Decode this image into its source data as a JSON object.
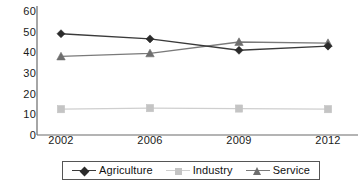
{
  "chart_data": {
    "type": "line",
    "title": "",
    "xlabel": "",
    "ylabel": "",
    "categories": [
      "2002",
      "2006",
      "2009",
      "2012"
    ],
    "x": [
      2002,
      2006,
      2009,
      2012
    ],
    "ylim": [
      0,
      60
    ],
    "yticks": [
      0,
      10,
      20,
      30,
      40,
      50,
      60
    ],
    "ytick_labels": [
      "0",
      "10",
      "20",
      "30",
      "40",
      "50",
      "60"
    ],
    "grid": false,
    "legend_position": "bottom",
    "series": [
      {
        "name": "Agriculture",
        "marker": "diamond",
        "color": "#2b2b2b",
        "line_color": "#3a3a3a",
        "values": [
          49,
          46.5,
          41,
          43
        ]
      },
      {
        "name": "Industry",
        "marker": "square",
        "color": "#c4c4c4",
        "line_color": "#cfcfcf",
        "values": [
          12.5,
          13,
          12.8,
          12.5
        ]
      },
      {
        "name": "Service",
        "marker": "triangle",
        "color": "#6e6e6e",
        "line_color": "#7a7a7a",
        "values": [
          38,
          39.5,
          45,
          44.5
        ]
      }
    ]
  },
  "axes": {
    "axis_color": "#6b6b6b",
    "text_color": "#1a1a1a"
  },
  "legend": {
    "border_color": "#555555",
    "items": [
      {
        "label": "Agriculture"
      },
      {
        "label": "Industry"
      },
      {
        "label": "Service"
      }
    ]
  }
}
